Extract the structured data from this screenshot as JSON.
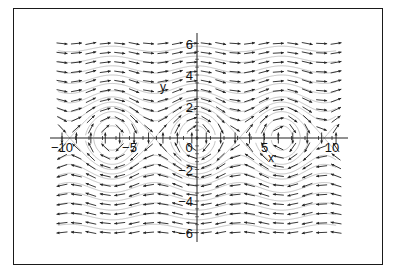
{
  "chart_data": {
    "type": "vector_field",
    "title": "",
    "system": {
      "dx": "y",
      "dy": "-sin(x)"
    },
    "xlabel": "x",
    "ylabel": "y",
    "xlim": [
      -11,
      11
    ],
    "ylim": [
      -6.5,
      6.5
    ],
    "x_ticks": [
      -10,
      -5,
      0,
      5,
      10
    ],
    "x_tick_labels": [
      "-10",
      "-5",
      "0",
      "5",
      "10"
    ],
    "y_ticks": [
      -6,
      -4,
      -2,
      2,
      4,
      6
    ],
    "y_tick_labels": [
      "6",
      "4",
      "2",
      "2",
      "4",
      "6"
    ],
    "y_tick_labels_ordered": [
      {
        "value": 6,
        "label": "6"
      },
      {
        "value": 4,
        "label": "4"
      },
      {
        "value": 2,
        "label": "2"
      },
      {
        "value": -2,
        "label": "2"
      },
      {
        "value": -4,
        "label": "4"
      },
      {
        "value": -6,
        "label": "6"
      }
    ],
    "arrow_grid": {
      "x_min": -10,
      "x_max": 10.3,
      "cols": 20,
      "y_min": -6,
      "y_max": 6,
      "rows": 21
    },
    "centers": [
      -6.28,
      0,
      6.28
    ],
    "saddles": [
      -9.42,
      -3.14,
      3.14,
      9.42
    ],
    "streamline_energy_levels": [
      0.3,
      0.8,
      1.4,
      2.0,
      2.6,
      3.4,
      4.5,
      6,
      8,
      10.5,
      13.5,
      17
    ],
    "grid": false,
    "legend": null
  },
  "colors": {
    "arrow": "#222222",
    "streamline": "#b5b5b5",
    "axis": "#222222",
    "frame": "#1a1a1a"
  }
}
